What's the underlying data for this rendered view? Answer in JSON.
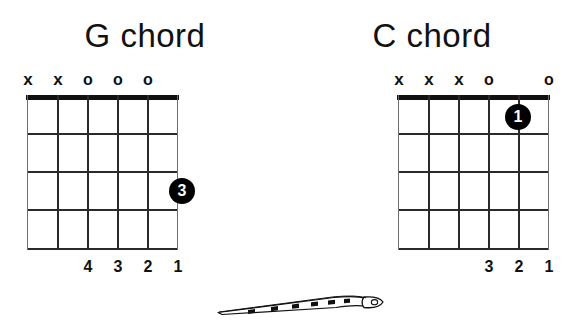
{
  "page": {
    "background_color": "#ffffff",
    "ink_color": "#111111"
  },
  "chords": [
    {
      "id": "g-chord",
      "title": "G chord",
      "strings": 6,
      "frets": 4,
      "top_markers": [
        "x",
        "x",
        "o",
        "o",
        "o",
        ""
      ],
      "finger_numbers": [
        "",
        "",
        "4",
        "3",
        "2",
        "1"
      ],
      "dots": [
        {
          "label": "3",
          "string_index": 5,
          "fret": 3
        }
      ]
    },
    {
      "id": "c-chord",
      "title": "C chord",
      "strings": 6,
      "frets": 4,
      "top_markers": [
        "x",
        "x",
        "x",
        "o",
        "",
        "o"
      ],
      "finger_numbers": [
        "",
        "",
        "",
        "3",
        "2",
        "1"
      ],
      "dots": [
        {
          "label": "1",
          "string_index": 4,
          "fret": 1
        }
      ]
    }
  ],
  "illustration": {
    "name": "guitar-neck-side-view",
    "description": "guitar neck drawn in perspective with headstock and tuning peg at right"
  }
}
